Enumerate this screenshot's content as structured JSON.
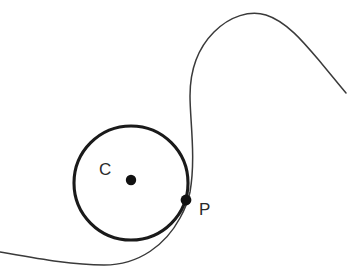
{
  "figure": {
    "caption": "the curve at point P .",
    "background_color": "#ffffff",
    "width": 356,
    "height": 276
  },
  "labels": {
    "center_label": "C",
    "point_label": "P"
  },
  "geometry": {
    "circle": {
      "name": "osculating-circle",
      "cx": 131,
      "cy": 183,
      "r": 57,
      "stroke": "#1a1a1a",
      "stroke_width": 3.1,
      "fill": "none"
    },
    "center_dot": {
      "name": "center-point-C",
      "cx": 131,
      "cy": 180,
      "r": 5.2,
      "fill": "#111111"
    },
    "tangent_dot": {
      "name": "tangency-point-P",
      "cx": 186,
      "cy": 200,
      "r": 5.4,
      "fill": "#111111"
    },
    "curve": {
      "name": "plane-curve",
      "stroke": "#3a3a3a",
      "stroke_width": 1.5,
      "fill": "none",
      "path": "M 0 252 C 40 259 72 265 104 265 C 140 265 166 244 180 218 C 186 207 188 202 190 192 C 196 158 190 120 190 96 C 190 70 198 48 214 32 C 230 16 250 10 266 15 C 288 22 306 45 322 64 C 332 76 340 86 346 93"
    }
  },
  "colors": {
    "ink": "#1a1a1a",
    "curve_ink": "#3a3a3a",
    "label_ink": "#2a2a2a",
    "paper": "#ffffff"
  }
}
